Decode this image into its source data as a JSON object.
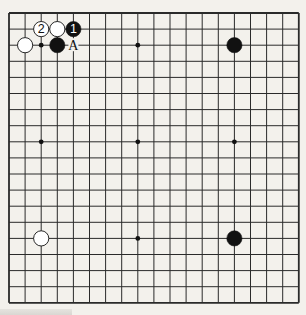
{
  "board": {
    "size": 19,
    "origin": {
      "x": 9,
      "y": 13
    },
    "spacing": 16.1,
    "background": "#f3f1ec",
    "line_color": "#2a2a2a",
    "hoshi": [
      [
        3,
        3
      ],
      [
        9,
        3
      ],
      [
        15,
        3
      ],
      [
        3,
        9
      ],
      [
        9,
        9
      ],
      [
        15,
        9
      ],
      [
        3,
        15
      ],
      [
        9,
        15
      ],
      [
        15,
        15
      ]
    ],
    "stones": [
      {
        "color": "white",
        "col": 3,
        "row": 2,
        "label": "2"
      },
      {
        "color": "white",
        "col": 4,
        "row": 2,
        "label": ""
      },
      {
        "color": "black",
        "col": 5,
        "row": 2,
        "label": "1"
      },
      {
        "color": "white",
        "col": 2,
        "row": 3,
        "label": ""
      },
      {
        "color": "black",
        "col": 4,
        "row": 3,
        "label": ""
      },
      {
        "color": "black",
        "col": 15,
        "row": 3,
        "label": ""
      },
      {
        "color": "white",
        "col": 3,
        "row": 15,
        "label": ""
      },
      {
        "color": "black",
        "col": 15,
        "row": 15,
        "label": ""
      }
    ],
    "marks": [
      {
        "col": 5,
        "row": 3,
        "text": "A"
      }
    ]
  }
}
